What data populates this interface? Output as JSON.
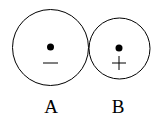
{
  "diagram": {
    "objects": [
      {
        "label": "A",
        "charge_sign": "−",
        "charge": "negative",
        "circle": {
          "cx": 50.5,
          "cy": 47.5,
          "r": 38
        },
        "dot": {
          "cx": 50.5,
          "cy": 47,
          "r": 3.5
        },
        "sign_pos": {
          "x": 50.5,
          "y": 63
        },
        "label_pos": {
          "x": 51,
          "y": 113
        }
      },
      {
        "label": "B",
        "charge_sign": "+",
        "charge": "positive",
        "circle": {
          "cx": 119.5,
          "cy": 48.5,
          "r": 30.5
        },
        "dot": {
          "cx": 119,
          "cy": 48,
          "r": 3.5
        },
        "sign_pos": {
          "x": 119,
          "y": 63
        },
        "label_pos": {
          "x": 118,
          "y": 113
        }
      }
    ],
    "colors": {
      "stroke": "#000000",
      "background": "#ffffff"
    }
  }
}
